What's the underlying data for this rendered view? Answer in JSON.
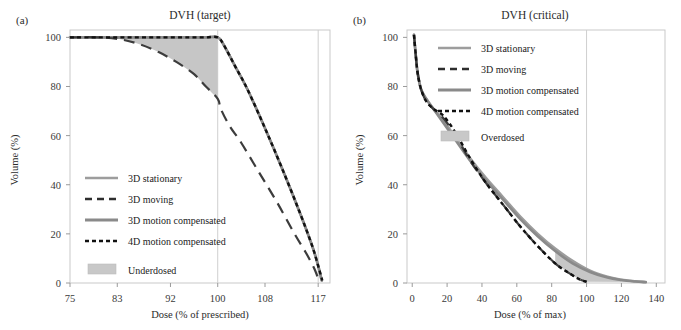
{
  "figure": {
    "panels": [
      {
        "tag": "(a)",
        "title": "DVH (target)",
        "xlabel": "Dose (% of prescribed)",
        "ylabel": "Volume (%)",
        "xticks": [
          "75",
          "83",
          "92",
          "100",
          "108",
          "117"
        ],
        "yticks": [
          "0",
          "20",
          "40",
          "60",
          "80",
          "100"
        ],
        "legend": [
          {
            "label": "3D stationary",
            "style": "solid-gray"
          },
          {
            "label": "3D moving",
            "style": "long-dash"
          },
          {
            "label": "3D motion compensated",
            "style": "solid-gray-dark"
          },
          {
            "label": "4D motion compensated",
            "style": "dotted"
          }
        ],
        "area_legend": {
          "label": "Underdosed",
          "color": "#c8c8c8"
        }
      },
      {
        "tag": "(b)",
        "title": "DVH (critical)",
        "xlabel": "Dose (% of max)",
        "ylabel": "Volume (%)",
        "xticks": [
          "0",
          "20",
          "40",
          "60",
          "80",
          "100",
          "120",
          "140"
        ],
        "yticks": [
          "0",
          "20",
          "40",
          "60",
          "80",
          "100"
        ],
        "legend": [
          {
            "label": "3D stationary",
            "style": "solid-gray"
          },
          {
            "label": "3D moving",
            "style": "long-dash"
          },
          {
            "label": "3D motion compensated",
            "style": "solid-gray-dark"
          },
          {
            "label": "4D motion compensated",
            "style": "dotted"
          }
        ],
        "area_legend": {
          "label": "Overdosed",
          "color": "#c8c8c8"
        }
      }
    ]
  },
  "chart_data": [
    {
      "type": "line",
      "title": "DVH (target)",
      "xlabel": "Dose (% of prescribed)",
      "ylabel": "Volume (%)",
      "xlim": [
        75,
        119
      ],
      "ylim": [
        0,
        103
      ],
      "xticks": [
        75,
        83,
        92,
        100,
        108,
        117
      ],
      "yticks": [
        0,
        20,
        40,
        60,
        80,
        100
      ],
      "grid": "vertical-at-100-and-117",
      "legend_position": "lower-left-inside",
      "shaded_region": {
        "name": "Underdosed",
        "color": "#c6c6c6",
        "upper_series": "3D stationary",
        "lower_series": "3D moving",
        "x_range": [
          75,
          100
        ]
      },
      "series": [
        {
          "name": "3D stationary",
          "style": "solid-gray",
          "x": [
            75,
            80,
            85,
            90,
            95,
            98,
            100,
            101,
            103,
            105,
            108,
            111,
            114,
            116,
            117,
            117.6
          ],
          "y": [
            100,
            100,
            100,
            100,
            100,
            100,
            100,
            97,
            88,
            79,
            63,
            46,
            28,
            15,
            7,
            1
          ]
        },
        {
          "name": "3D moving",
          "style": "long-dash",
          "x": [
            75,
            80,
            84,
            87,
            90,
            93,
            96,
            98,
            100,
            100.5,
            102,
            104,
            107,
            110,
            113,
            115,
            116.5,
            117.2
          ],
          "y": [
            100,
            100,
            99,
            97,
            94,
            90,
            85,
            80,
            75,
            71,
            64,
            57,
            45,
            33,
            20,
            12,
            5,
            0
          ]
        },
        {
          "name": "3D motion compensated",
          "style": "solid-gray-dark",
          "x": [
            75,
            80,
            85,
            90,
            95,
            98,
            100,
            101,
            103,
            105,
            108,
            111,
            114,
            116,
            117,
            117.6
          ],
          "y": [
            100,
            100,
            100,
            100,
            100,
            100,
            100,
            97,
            88,
            79,
            63,
            46,
            28,
            15,
            7,
            1
          ]
        },
        {
          "name": "4D motion compensated",
          "style": "dotted",
          "x": [
            75,
            80,
            85,
            90,
            95,
            98,
            100,
            101,
            103,
            105,
            108,
            111,
            114,
            116,
            117,
            117.7
          ],
          "y": [
            100,
            100,
            100,
            100,
            100,
            100,
            100,
            97,
            88,
            79,
            63,
            46,
            28,
            15,
            7,
            1
          ]
        }
      ]
    },
    {
      "type": "line",
      "title": "DVH (critical)",
      "xlabel": "Dose (% of max)",
      "ylabel": "Volume (%)",
      "xlim": [
        -3,
        145
      ],
      "ylim": [
        0,
        103
      ],
      "xticks": [
        0,
        20,
        40,
        60,
        80,
        100,
        120,
        140
      ],
      "yticks": [
        0,
        20,
        40,
        60,
        80,
        100
      ],
      "grid": "vertical-at-100",
      "legend_position": "upper-right-inside",
      "shaded_region": {
        "name": "Overdosed",
        "color": "#c6c6c6",
        "upper_series": "3D stationary",
        "lower_series": "4D motion compensated",
        "x_range": [
          80,
          135
        ]
      },
      "series": [
        {
          "name": "3D stationary",
          "style": "solid-gray",
          "x": [
            1,
            2,
            3,
            5,
            8,
            12,
            18,
            25,
            33,
            42,
            52,
            62,
            72,
            82,
            92,
            102,
            112,
            120,
            128,
            134
          ],
          "y": [
            101,
            93,
            86,
            79,
            75,
            71,
            66,
            59,
            51,
            43,
            35,
            27,
            20,
            14,
            9,
            5,
            2.5,
            1.3,
            0.7,
            0.4
          ]
        },
        {
          "name": "3D moving",
          "style": "long-dash",
          "x": [
            1,
            2,
            3,
            5,
            8,
            12,
            18,
            25,
            33,
            42,
            52,
            62,
            72,
            82,
            90,
            96,
            100
          ],
          "y": [
            101,
            93,
            86,
            79,
            74,
            71,
            67,
            60,
            50,
            41,
            32,
            23,
            15,
            8,
            4,
            1.5,
            0.5
          ]
        },
        {
          "name": "3D motion compensated",
          "style": "solid-gray-dark",
          "x": [
            1,
            2,
            3,
            5,
            8,
            12,
            18,
            25,
            33,
            42,
            52,
            62,
            72,
            82,
            92,
            102,
            112,
            120,
            128,
            134
          ],
          "y": [
            101,
            93,
            86,
            79,
            75,
            71,
            65,
            58,
            50,
            42,
            34,
            26,
            19,
            13,
            8,
            4.5,
            2.2,
            1.2,
            0.6,
            0.3
          ]
        },
        {
          "name": "4D motion compensated",
          "style": "dotted",
          "x": [
            1,
            2,
            3,
            5,
            8,
            12,
            18,
            25,
            33,
            42,
            52,
            62,
            72,
            82,
            90,
            96,
            100
          ],
          "y": [
            101,
            93,
            86,
            79,
            74,
            71,
            68,
            61,
            51,
            41,
            32,
            23,
            15,
            8,
            4,
            1.5,
            0.5
          ]
        }
      ]
    }
  ]
}
